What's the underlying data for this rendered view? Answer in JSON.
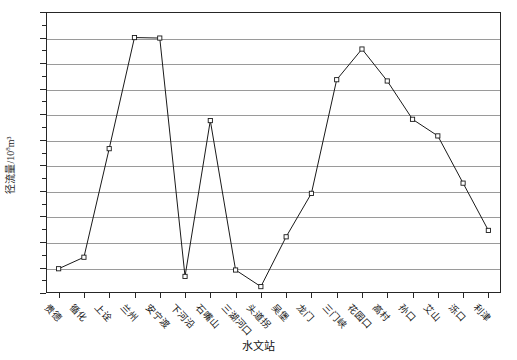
{
  "chart_data": {
    "type": "line",
    "title": "",
    "xlabel": "水文站",
    "ylabel": "径流量/10⁸m³",
    "ylabel_base": "径流量/10",
    "ylabel_exp": "8",
    "ylabel_unit": "m³",
    "ylim": [
      200,
      310
    ],
    "ytick_step": 10,
    "yticks": [
      200,
      210,
      220,
      230,
      240,
      250,
      260,
      270,
      280,
      290,
      300,
      310
    ],
    "ytick_labels": [
      "200",
      "210",
      "220",
      "230",
      "240",
      "250",
      "260",
      "270",
      "280",
      "290",
      "300",
      "310"
    ],
    "grid": true,
    "grid_axis": "y",
    "legend": "none",
    "marker": "open-square",
    "line_color": "#1a1a1a",
    "grid_color": "#9a9a9a",
    "axis_color": "#262626",
    "categories": [
      "贵德",
      "循化",
      "上诠",
      "兰州",
      "安宁渡",
      "下河沿",
      "石嘴山",
      "三湖河口",
      "头道拐",
      "吴堡",
      "龙门",
      "三门峡",
      "花园口",
      "高村",
      "孙口",
      "艾山",
      "泺口",
      "利津"
    ],
    "values": [
      209.5,
      214.0,
      256.5,
      300.0,
      299.8,
      206.5,
      267.5,
      209.0,
      202.5,
      222.0,
      239.0,
      283.5,
      295.5,
      283.0,
      268.0,
      261.5,
      243.0,
      224.5
    ]
  }
}
